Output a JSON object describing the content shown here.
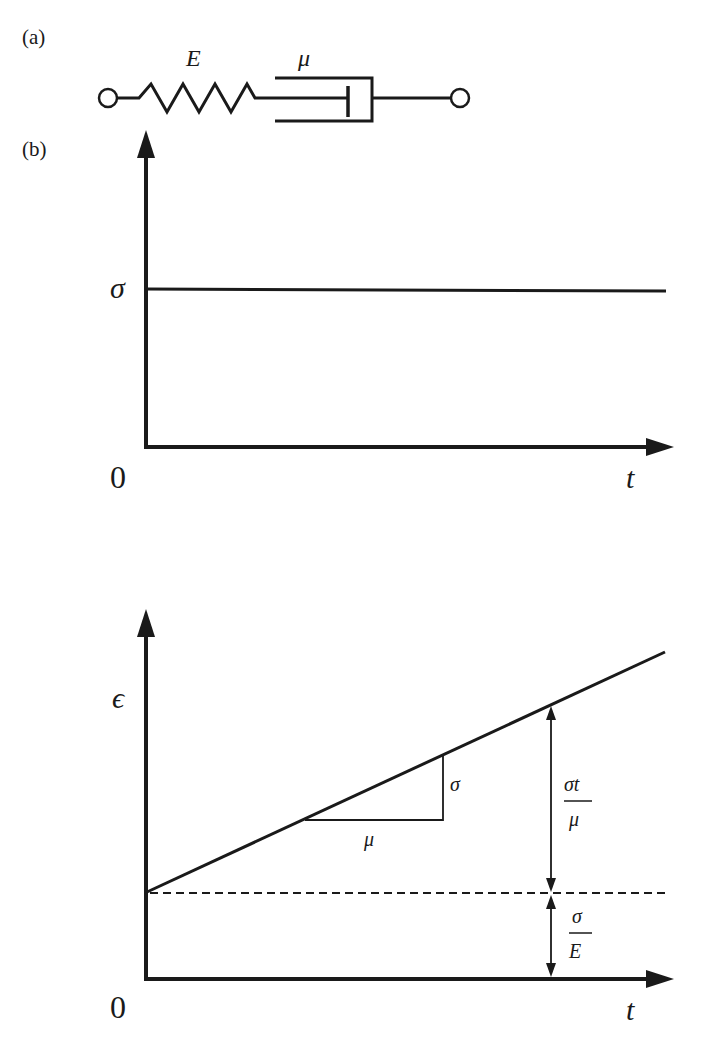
{
  "figure": {
    "panel_a": {
      "label": "(a)",
      "spring_label": "E",
      "dashpot_label": "μ"
    },
    "panel_b": {
      "label": "(b)",
      "stress_plot": {
        "y_label": "σ",
        "x_label": "t",
        "origin_label": "0"
      },
      "strain_plot": {
        "y_label": "ϵ",
        "x_label": "t",
        "origin_label": "0",
        "slope_run_label": "μ",
        "slope_rise_label": "σ",
        "viscous_numerator": "σt",
        "viscous_denominator": "μ",
        "elastic_numerator": "σ",
        "elastic_denominator": "E"
      }
    },
    "colors": {
      "ink": "#1a1a1a",
      "background": "#ffffff"
    }
  }
}
